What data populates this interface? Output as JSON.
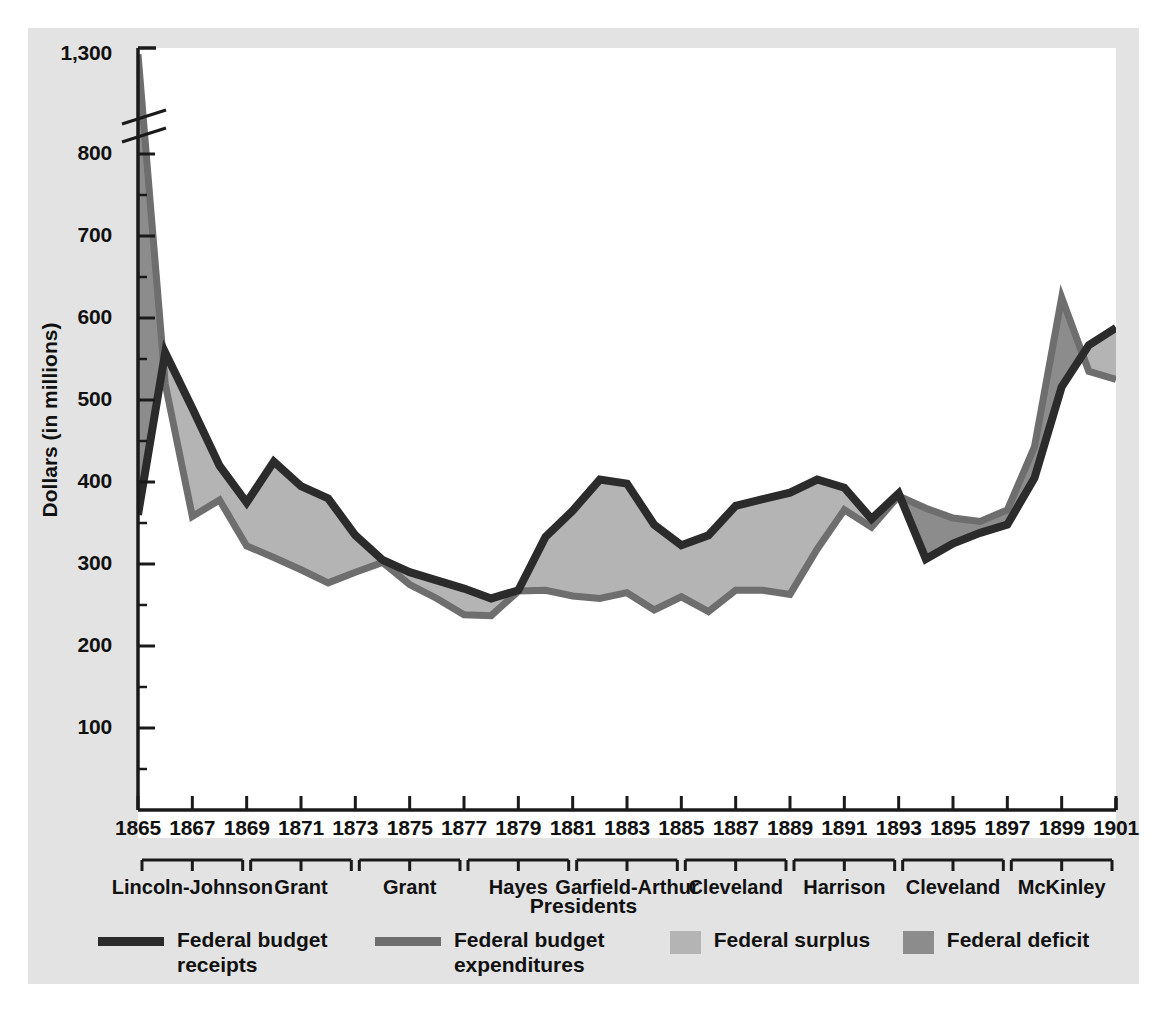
{
  "chart_data": {
    "type": "area",
    "title": "",
    "xlabel": "Presidents",
    "ylabel": "Dollars (in millions)",
    "x_tick_labels": [
      "1865",
      "1867",
      "1869",
      "1871",
      "1873",
      "1875",
      "1877",
      "1879",
      "1881",
      "1883",
      "1885",
      "1887",
      "1889",
      "1891",
      "1893",
      "1895",
      "1897",
      "1899",
      "1901"
    ],
    "x_range": [
      1865,
      1901
    ],
    "y_tick_labels": [
      "100",
      "200",
      "300",
      "400",
      "500",
      "600",
      "700",
      "800",
      "1,300"
    ],
    "y_tick_values": [
      100,
      200,
      300,
      400,
      500,
      600,
      700,
      800,
      1300
    ],
    "y_axis_break": true,
    "y_axis_break_between": [
      800,
      1300
    ],
    "ylim": [
      0,
      1300
    ],
    "grid": false,
    "legend_position": "bottom",
    "x": [
      1865,
      1866,
      1867,
      1868,
      1869,
      1870,
      1871,
      1872,
      1873,
      1874,
      1875,
      1876,
      1877,
      1878,
      1879,
      1880,
      1881,
      1882,
      1883,
      1884,
      1885,
      1886,
      1887,
      1888,
      1889,
      1890,
      1891,
      1892,
      1893,
      1894,
      1895,
      1896,
      1897,
      1898,
      1899,
      1900,
      1901
    ],
    "series": [
      {
        "name": "Federal budget receipts",
        "color": "#2b2b2b",
        "values": [
          360,
          558,
          490,
          420,
          375,
          425,
          395,
          380,
          335,
          305,
          290,
          280,
          270,
          258,
          268,
          333,
          365,
          403,
          398,
          348,
          323,
          335,
          371,
          379,
          387,
          403,
          393,
          355,
          386,
          306,
          325,
          338,
          348,
          405,
          516,
          567,
          588
        ]
      },
      {
        "name": "Federal budget expenditures",
        "color": "#6e6e6e",
        "values": [
          1298,
          520,
          358,
          378,
          322,
          308,
          293,
          277,
          290,
          302,
          275,
          258,
          238,
          237,
          267,
          268,
          261,
          258,
          265,
          244,
          260,
          242,
          268,
          268,
          263,
          318,
          366,
          345,
          383,
          368,
          356,
          352,
          366,
          443,
          625,
          535,
          525
        ]
      }
    ],
    "areas": [
      {
        "name": "Federal surplus",
        "color": "#b4b4b4",
        "description": "receipts above expenditures"
      },
      {
        "name": "Federal deficit",
        "color": "#8c8c8c",
        "description": "expenditures above receipts"
      }
    ],
    "president_groups": [
      {
        "label": "Lincoln-Johnson",
        "start": 1865,
        "end": 1869
      },
      {
        "label": "Grant",
        "start": 1869,
        "end": 1873
      },
      {
        "label": "Grant",
        "start": 1873,
        "end": 1877
      },
      {
        "label": "Hayes",
        "start": 1877,
        "end": 1881
      },
      {
        "label": "Garfield-Arthur",
        "start": 1881,
        "end": 1885
      },
      {
        "label": "Cleveland",
        "start": 1885,
        "end": 1889
      },
      {
        "label": "Harrison",
        "start": 1889,
        "end": 1893
      },
      {
        "label": "Cleveland",
        "start": 1893,
        "end": 1897
      },
      {
        "label": "McKinley",
        "start": 1897,
        "end": 1901
      }
    ],
    "legend": [
      {
        "label": "Federal budget receipts",
        "line1": "Federal budget",
        "line2": "receipts",
        "type": "line",
        "color": "#2b2b2b"
      },
      {
        "label": "Federal budget expenditures",
        "line1": "Federal budget",
        "line2": "expenditures",
        "type": "line",
        "color": "#6e6e6e"
      },
      {
        "label": "Federal surplus",
        "line1": "Federal surplus",
        "line2": "",
        "type": "swatch",
        "color": "#b4b4b4"
      },
      {
        "label": "Federal deficit",
        "line1": "Federal deficit",
        "line2": "",
        "type": "swatch",
        "color": "#8c8c8c"
      }
    ],
    "colors": {
      "figure_background": "#e3e3e3",
      "plot_background": "#ffffff",
      "axis": "#1a1a1a",
      "receipts_line": "#2b2b2b",
      "expenditures_line": "#6e6e6e",
      "surplus_fill": "#b4b4b4",
      "deficit_fill": "#8c8c8c"
    }
  }
}
